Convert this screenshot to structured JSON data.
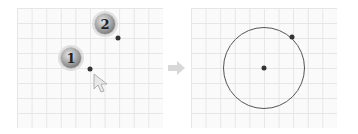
{
  "diagram": {
    "left_panel": {
      "steps": [
        {
          "label": "1",
          "badge_x": 71,
          "badge_y": 58,
          "point_x": 90,
          "point_y": 69
        },
        {
          "label": "2",
          "badge_x": 105,
          "badge_y": 24,
          "point_x": 118,
          "point_y": 38
        }
      ],
      "cursor": {
        "x": 95,
        "y": 75
      }
    },
    "arrow": {
      "icon": "right-arrow-icon",
      "color": "#d8d8d8"
    },
    "right_panel": {
      "circle": {
        "center_x": 264,
        "center_y": 68,
        "radius": 41,
        "color": "#555555"
      },
      "center_point": {
        "x": 264,
        "y": 68
      },
      "radius_point": {
        "x": 292,
        "y": 37
      }
    }
  }
}
